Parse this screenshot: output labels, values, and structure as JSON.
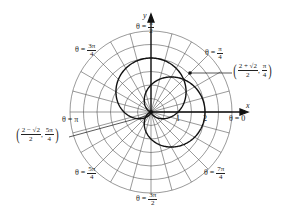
{
  "diagram": {
    "type": "polar-graph",
    "curves": [
      {
        "name": "cardioid-horizontal",
        "equation": "r = 1 + cos θ"
      },
      {
        "name": "cardioid-vertical",
        "equation": "r = 1 + sin θ"
      }
    ],
    "grid": {
      "circle_step": 0.5,
      "max_radius": 3,
      "radial_step_deg": 15
    },
    "axes": {
      "x_label": "x",
      "y_label": "y"
    },
    "radius_ticks": [
      "1",
      "2"
    ],
    "angle_labels": {
      "pi_over_2": {
        "prefix": "θ =",
        "num": "π",
        "den": "2"
      },
      "pi_over_4": {
        "prefix": "θ =",
        "num": "π",
        "den": "4"
      },
      "three_pi_over_4": {
        "prefix": "θ =",
        "num": "3π",
        "den": "4"
      },
      "pi": {
        "text": "θ = π"
      },
      "zero": {
        "text": "θ = 0"
      },
      "five_pi_over_4": {
        "prefix": "θ =",
        "num": "5π",
        "den": "4"
      },
      "three_pi_over_2": {
        "prefix": "θ =",
        "num": "3π",
        "den": "2"
      },
      "seven_pi_over_4": {
        "prefix": "θ =",
        "num": "7π",
        "den": "4"
      }
    },
    "intersection_points": [
      {
        "r_num": "2 + √2",
        "r_den": "2",
        "theta_num": "π",
        "theta_den": "4"
      },
      {
        "r_num": "2 − √2",
        "r_den": "2",
        "theta_num": "5π",
        "theta_den": "4"
      }
    ]
  }
}
